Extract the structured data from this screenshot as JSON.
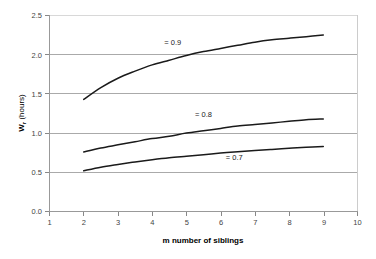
{
  "chart_data": {
    "type": "line",
    "title": "",
    "xlabel": "m number of siblings",
    "ylabel": "W (hours)",
    "ylabel_main": "W",
    "ylabel_subscript": "r",
    "ylabel_units": " (hours)",
    "xlim": [
      1,
      10
    ],
    "ylim": [
      0.0,
      2.5
    ],
    "xticks": [
      1,
      2,
      3,
      4,
      5,
      6,
      7,
      8,
      9,
      10
    ],
    "xtick_labels": [
      "1",
      "2",
      "3",
      "4",
      "5",
      "6",
      "7",
      "8",
      "9",
      "10"
    ],
    "yticks": [
      0.0,
      0.5,
      1.0,
      1.5,
      2.0,
      2.5
    ],
    "ytick_labels": [
      "0.0",
      "0.5",
      "1.0",
      "1.5",
      "2.0",
      "2.5"
    ],
    "grid": "horizontal",
    "gridline_values": [
      0.5,
      1.0,
      1.5,
      2.0,
      2.5
    ],
    "legend": "inline-annotations",
    "curve_color": "#1a1a1a",
    "series": [
      {
        "name": "= 0.9",
        "label": "= 0.9",
        "label_x": 4.6,
        "label_y": 2.12,
        "x": [
          2,
          2.5,
          3,
          3.5,
          4,
          4.5,
          5,
          5.5,
          6,
          6.5,
          7,
          7.5,
          8,
          8.5,
          9
        ],
        "values": [
          1.43,
          1.58,
          1.7,
          1.79,
          1.87,
          1.93,
          1.99,
          2.04,
          2.08,
          2.12,
          2.16,
          2.19,
          2.21,
          2.23,
          2.25
        ]
      },
      {
        "name": "= 0.8",
        "label": "= 0.8",
        "label_x": 5.5,
        "label_y": 1.2,
        "x": [
          2,
          2.5,
          3,
          3.5,
          4,
          4.5,
          5,
          5.5,
          6,
          6.5,
          7,
          7.5,
          8,
          8.5,
          9
        ],
        "values": [
          0.76,
          0.81,
          0.85,
          0.89,
          0.93,
          0.96,
          1.0,
          1.03,
          1.06,
          1.09,
          1.11,
          1.13,
          1.15,
          1.17,
          1.18
        ]
      },
      {
        "name": "= 0.7",
        "label": "= 0.7",
        "label_x": 6.4,
        "label_y": 0.655,
        "x": [
          2,
          2.5,
          3,
          3.5,
          4,
          4.5,
          5,
          5.5,
          6,
          6.5,
          7,
          7.5,
          8,
          8.5,
          9
        ],
        "values": [
          0.52,
          0.565,
          0.6,
          0.632,
          0.66,
          0.685,
          0.705,
          0.725,
          0.745,
          0.762,
          0.778,
          0.792,
          0.806,
          0.818,
          0.83
        ]
      }
    ]
  }
}
